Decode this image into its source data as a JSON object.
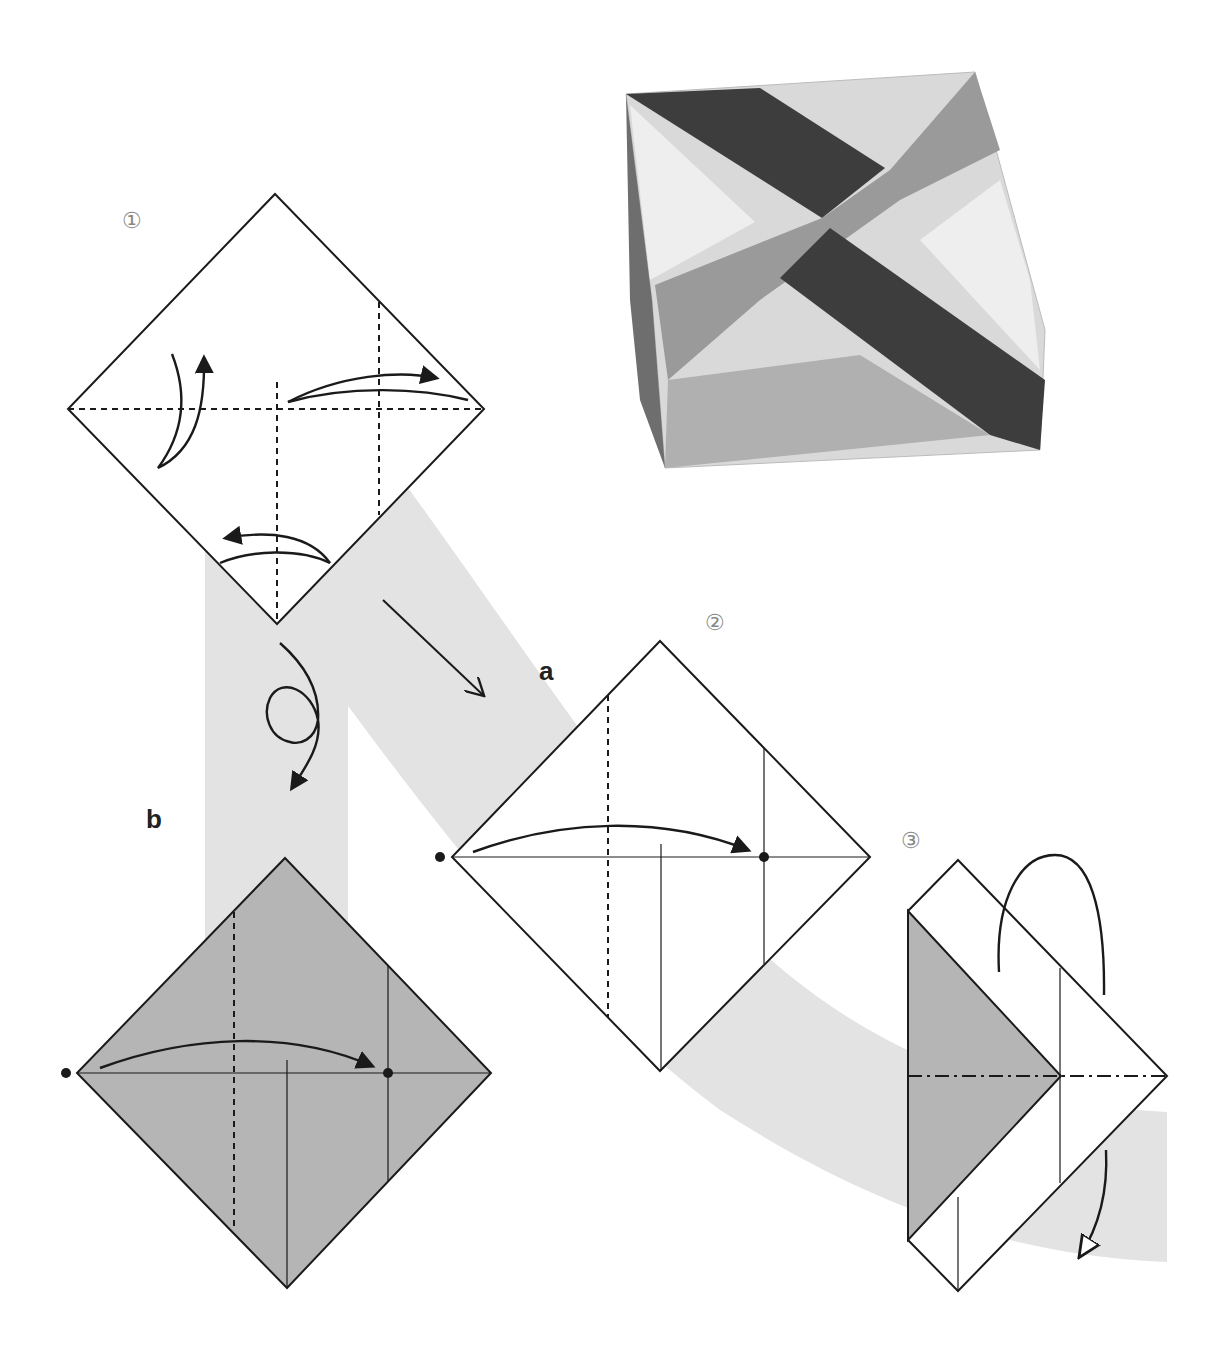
{
  "diagram": {
    "type": "origami instruction diagram",
    "colors": {
      "line": "#1a1a1a",
      "band": "#e3e3e3",
      "colored_side": "#b5b5b5",
      "step_number": "#888888"
    },
    "photo": {
      "subject": "finished origami box with crossed diagonal strips and floral-patterned corners",
      "colors": [
        "#3d3d3d",
        "#9a9a9a",
        "#d9d9d9",
        "#c8c8c8"
      ]
    },
    "steps": [
      {
        "id": "step1",
        "label": "①",
        "folds": [
          "valley fold horizontal diagonal",
          "valley fold vertical center (lower half)",
          "valley fold vertical right quarter"
        ],
        "arrows": [
          "fold and unfold up-left",
          "fold and unfold right",
          "fold and unfold bottom"
        ]
      },
      {
        "id": "step2",
        "label": "②",
        "variant_label": "a",
        "folds": [
          "valley fold left quarter",
          "crease center",
          "crease right quarter"
        ],
        "arrows": [
          "bring left dot to right dot"
        ]
      },
      {
        "id": "step2b",
        "variant_label": "b",
        "side": "colored",
        "arrows": [
          "turn over",
          "bring left dot to right dot"
        ]
      },
      {
        "id": "step3",
        "label": "③",
        "folds": [
          "mountain fold horizontal"
        ],
        "arrows": [
          "mountain fold behind"
        ]
      }
    ]
  }
}
